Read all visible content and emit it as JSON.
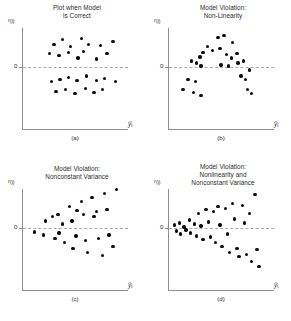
{
  "figure": {
    "axis_labels": {
      "y": "r",
      "y_sub": "(i)",
      "x": "ŷ",
      "x_sub": "i",
      "zero_tick": "0"
    },
    "colors": {
      "point": "#0d0d0d",
      "axis": "#8e8e8e",
      "zero_line": "#a9a9a9",
      "text": "#2b2b2b",
      "background": "#ffffff"
    }
  },
  "chart_data": [
    {
      "type": "scatter",
      "id": "a",
      "title": "Plot when Model\nis Correct",
      "panel_label": "(a)",
      "xlabel": "ŷi",
      "ylabel": "r(i)",
      "xlim": [
        0,
        100
      ],
      "ylim": [
        -50,
        50
      ],
      "grid": false,
      "legend": "none",
      "annotations": [
        "zero reference line at r = 0"
      ],
      "points": [
        {
          "x": 30,
          "y": 22
        },
        {
          "x": 38,
          "y": 27
        },
        {
          "x": 46,
          "y": 20
        },
        {
          "x": 56,
          "y": 28
        },
        {
          "x": 63,
          "y": 22
        },
        {
          "x": 74,
          "y": 21
        },
        {
          "x": 86,
          "y": 25
        },
        {
          "x": 26,
          "y": 13
        },
        {
          "x": 35,
          "y": 11
        },
        {
          "x": 44,
          "y": 14
        },
        {
          "x": 53,
          "y": 9
        },
        {
          "x": 58,
          "y": 15
        },
        {
          "x": 70,
          "y": 8
        },
        {
          "x": 80,
          "y": 13
        },
        {
          "x": 28,
          "y": -14
        },
        {
          "x": 36,
          "y": -12
        },
        {
          "x": 44,
          "y": -10
        },
        {
          "x": 52,
          "y": -13
        },
        {
          "x": 61,
          "y": -9
        },
        {
          "x": 70,
          "y": -13
        },
        {
          "x": 78,
          "y": -11
        },
        {
          "x": 88,
          "y": -14
        },
        {
          "x": 32,
          "y": -24
        },
        {
          "x": 41,
          "y": -22
        },
        {
          "x": 50,
          "y": -26
        },
        {
          "x": 60,
          "y": -21
        },
        {
          "x": 68,
          "y": -25
        },
        {
          "x": 76,
          "y": -22
        }
      ]
    },
    {
      "type": "scatter",
      "id": "b",
      "title": "Model Violation:\nNon-Linearity",
      "panel_label": "(b)",
      "xlabel": "ŷi",
      "ylabel": "r(i)",
      "xlim": [
        0,
        100
      ],
      "ylim": [
        -50,
        50
      ],
      "grid": false,
      "legend": "none",
      "annotations": [
        "inverted-U curved pattern of residuals"
      ],
      "points": [
        {
          "x": 14,
          "y": -22
        },
        {
          "x": 19,
          "y": -12
        },
        {
          "x": 24,
          "y": -25
        },
        {
          "x": 26,
          "y": -14
        },
        {
          "x": 31,
          "y": -28
        },
        {
          "x": 22,
          "y": 6
        },
        {
          "x": 27,
          "y": 4
        },
        {
          "x": 30,
          "y": 10
        },
        {
          "x": 33,
          "y": 14
        },
        {
          "x": 31,
          "y": 1
        },
        {
          "x": 37,
          "y": 20
        },
        {
          "x": 42,
          "y": 16
        },
        {
          "x": 47,
          "y": 29
        },
        {
          "x": 53,
          "y": 31
        },
        {
          "x": 49,
          "y": 18
        },
        {
          "x": 55,
          "y": 12
        },
        {
          "x": 61,
          "y": 24
        },
        {
          "x": 60,
          "y": 9
        },
        {
          "x": 65,
          "y": 13
        },
        {
          "x": 50,
          "y": 2
        },
        {
          "x": 57,
          "y": 1
        },
        {
          "x": 66,
          "y": 4
        },
        {
          "x": 71,
          "y": 6
        },
        {
          "x": 69,
          "y": -9
        },
        {
          "x": 73,
          "y": -12
        },
        {
          "x": 77,
          "y": -3
        },
        {
          "x": 75,
          "y": -22
        },
        {
          "x": 79,
          "y": -26
        }
      ]
    },
    {
      "type": "scatter",
      "id": "c",
      "title": "Model Violation:\nNonconstant Variance",
      "panel_label": "(c)",
      "xlabel": "ŷi",
      "ylabel": "r(i)",
      "xlim": [
        0,
        100
      ],
      "ylim": [
        -50,
        50
      ],
      "grid": false,
      "legend": "none",
      "annotations": [
        "fan / megaphone shape, spread increases with ŷ"
      ],
      "points": [
        {
          "x": 12,
          "y": -4
        },
        {
          "x": 20,
          "y": -7
        },
        {
          "x": 22,
          "y": 7
        },
        {
          "x": 29,
          "y": 11
        },
        {
          "x": 31,
          "y": -10
        },
        {
          "x": 34,
          "y": 13
        },
        {
          "x": 38,
          "y": 4
        },
        {
          "x": 40,
          "y": -14
        },
        {
          "x": 45,
          "y": 21
        },
        {
          "x": 47,
          "y": 7
        },
        {
          "x": 48,
          "y": -20
        },
        {
          "x": 51,
          "y": -8
        },
        {
          "x": 56,
          "y": 26
        },
        {
          "x": 58,
          "y": 13
        },
        {
          "x": 60,
          "y": -12
        },
        {
          "x": 62,
          "y": -24
        },
        {
          "x": 66,
          "y": 30
        },
        {
          "x": 68,
          "y": 11
        },
        {
          "x": 70,
          "y": 16
        },
        {
          "x": 72,
          "y": -10
        },
        {
          "x": 76,
          "y": -27
        },
        {
          "x": 78,
          "y": 34
        },
        {
          "x": 80,
          "y": 18
        },
        {
          "x": 82,
          "y": -7
        },
        {
          "x": 86,
          "y": -18
        },
        {
          "x": 89,
          "y": 38
        },
        {
          "x": 52,
          "y": 17
        },
        {
          "x": 35,
          "y": -5
        }
      ]
    },
    {
      "type": "scatter",
      "id": "d",
      "title": "Model Violation:\nNonlinearity and\nNonconstant Variance",
      "panel_label": "(d)",
      "xlabel": "ŷi",
      "ylabel": "r(i)",
      "xlim": [
        0,
        100
      ],
      "ylim": [
        -50,
        50
      ],
      "grid": false,
      "legend": "none",
      "annotations": [
        "curvature combined with increasing spread"
      ],
      "points": [
        {
          "x": 6,
          "y": 3
        },
        {
          "x": 8,
          "y": -3
        },
        {
          "x": 11,
          "y": 5
        },
        {
          "x": 12,
          "y": -6
        },
        {
          "x": 15,
          "y": 1
        },
        {
          "x": 17,
          "y": -2
        },
        {
          "x": 20,
          "y": 8
        },
        {
          "x": 21,
          "y": -5
        },
        {
          "x": 25,
          "y": 4
        },
        {
          "x": 27,
          "y": -8
        },
        {
          "x": 29,
          "y": 14
        },
        {
          "x": 31,
          "y": 2
        },
        {
          "x": 33,
          "y": -11
        },
        {
          "x": 36,
          "y": 18
        },
        {
          "x": 38,
          "y": 6
        },
        {
          "x": 40,
          "y": -9
        },
        {
          "x": 43,
          "y": 16
        },
        {
          "x": 45,
          "y": -14
        },
        {
          "x": 47,
          "y": 21
        },
        {
          "x": 49,
          "y": 3
        },
        {
          "x": 51,
          "y": -18
        },
        {
          "x": 54,
          "y": 19
        },
        {
          "x": 56,
          "y": -6
        },
        {
          "x": 58,
          "y": -24
        },
        {
          "x": 61,
          "y": 24
        },
        {
          "x": 63,
          "y": 9
        },
        {
          "x": 65,
          "y": -20
        },
        {
          "x": 67,
          "y": -28
        },
        {
          "x": 70,
          "y": 22
        },
        {
          "x": 72,
          "y": 5
        },
        {
          "x": 74,
          "y": -26
        },
        {
          "x": 77,
          "y": 14
        },
        {
          "x": 79,
          "y": -33
        },
        {
          "x": 82,
          "y": 33
        },
        {
          "x": 84,
          "y": -21
        },
        {
          "x": 86,
          "y": -38
        }
      ]
    }
  ]
}
